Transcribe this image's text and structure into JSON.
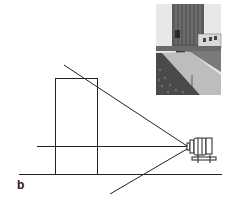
{
  "figure": {
    "label": "b",
    "colors": {
      "line": "#222222",
      "background": "#ffffff",
      "sky": "#e8e8e8",
      "building": "#555555",
      "road": "#7a7a7a",
      "sidewalk": "#bdbdbd",
      "foliage": "#4a4a4a"
    }
  },
  "photo": {
    "subject": "tall-building-street-view",
    "x": 156,
    "y": 4,
    "width": 65,
    "height": 91
  },
  "geometry": {
    "building_rect": {
      "x": 55,
      "y": 78,
      "width": 42,
      "height": 96
    },
    "ground_line": {
      "x1": 19,
      "y1": 174,
      "x2": 222,
      "y2": 174
    },
    "optical_axis": {
      "x1": 37,
      "y1": 146,
      "x2": 187,
      "y2": 146
    },
    "upper_ray": {
      "x1": 64,
      "y1": 65,
      "x2": 187,
      "y2": 146
    },
    "lower_ray": {
      "x1": 187,
      "y1": 149,
      "x2": 110,
      "y2": 194
    },
    "camera": {
      "x": 187,
      "y": 136
    }
  }
}
